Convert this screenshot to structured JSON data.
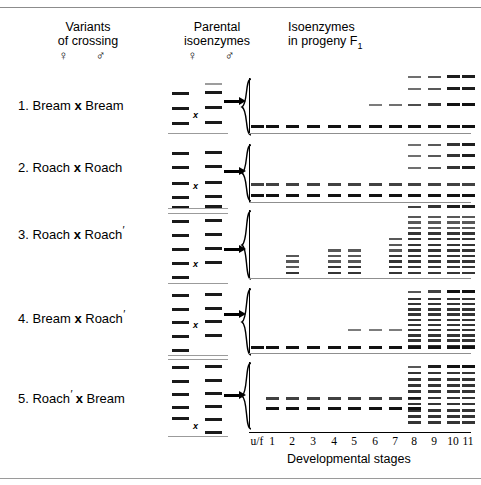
{
  "figure": {
    "headers": {
      "variants": {
        "line1": "Variants",
        "line2": "of crossing",
        "symbols": "♀ ♂"
      },
      "parental": {
        "line1": "Parental",
        "line2": "isoenzymes",
        "symbols": "♀ ♂"
      },
      "progeny": {
        "line1": "Isoenzymes",
        "line2": "in progeny F",
        "subscript": "1"
      }
    },
    "axis": {
      "title": "Developmental stages",
      "ticks": [
        "u/f",
        "1",
        "2",
        "3",
        "4",
        "5",
        "6",
        "7",
        "8",
        "9",
        "10",
        "11"
      ]
    },
    "colors": {
      "band": "#111111",
      "faint_band": "#9d9d9d",
      "rule": "#8c8c8c",
      "axis": "#8f8f8f"
    },
    "cross_symbol": "x",
    "prime_symbol": "′"
  },
  "chart_data": {
    "type": "heatmap",
    "xlabel": "Developmental stages",
    "ylabel": "Isoenzyme band mobility",
    "categories": [
      "u/f",
      "1",
      "2",
      "3",
      "4",
      "5",
      "6",
      "7",
      "8",
      "9",
      "10",
      "11"
    ],
    "legend": "none",
    "grid": false,
    "series": [
      {
        "name": "1. Bream x Bream",
        "female_parent_bands": 3,
        "male_parent_bands": 4,
        "stage_band_counts": [
          1,
          1,
          1,
          1,
          1,
          1,
          2,
          2,
          4,
          4,
          4,
          4
        ],
        "notes": "Single fast band across all stages; upper bands appear from stage 6-8 onward"
      },
      {
        "name": "2. Roach x Roach",
        "female_parent_bands": 4,
        "male_parent_bands": 4,
        "stage_band_counts": [
          2,
          2,
          2,
          2,
          2,
          2,
          2,
          2,
          5,
          5,
          5,
          5
        ],
        "notes": "Two bands through early stages; four-band upper cluster from stage 8"
      },
      {
        "name": "3. Roach x Roach'",
        "female_parent_bands": 6,
        "male_parent_bands": 5,
        "stage_band_counts": [
          0,
          0,
          4,
          0,
          5,
          5,
          0,
          7,
          11,
          11,
          11,
          11
        ],
        "notes": "Dense multi-band ladders increasing with developmental stage"
      },
      {
        "name": "4. Bream x Roach'",
        "female_parent_bands": 4,
        "male_parent_bands": 5,
        "stage_band_counts": [
          1,
          1,
          1,
          1,
          1,
          2,
          2,
          2,
          10,
          10,
          10,
          10
        ],
        "notes": "Single basal band; hybrid ladder emerges at stage 8"
      },
      {
        "name": "5. Roach' x Bream",
        "female_parent_bands": 6,
        "male_parent_bands": 6,
        "stage_band_counts": [
          0,
          2,
          2,
          2,
          2,
          2,
          2,
          2,
          9,
          9,
          9,
          9
        ],
        "notes": "Doublet through mid stages; dense ladder at late stages"
      }
    ]
  },
  "crosses": [
    {
      "index": "1.",
      "female": "Bream",
      "female_prime": false,
      "male": "Bream",
      "male_prime": false,
      "label": "1. Bream x Bream"
    },
    {
      "index": "2.",
      "female": "Roach",
      "female_prime": false,
      "male": "Roach",
      "male_prime": false,
      "label": "2. Roach x Roach"
    },
    {
      "index": "3.",
      "female": "Roach",
      "female_prime": false,
      "male": "Roach",
      "male_prime": true,
      "label": "3. Roach x Roach ′"
    },
    {
      "index": "4.",
      "female": "Bream",
      "female_prime": false,
      "male": "Roach",
      "male_prime": true,
      "label": "4. Bream x Roach ′"
    },
    {
      "index": "5.",
      "female": "Roach",
      "female_prime": true,
      "male": "Bream",
      "male_prime": false,
      "label": "5. Roach ′ x Bream"
    }
  ]
}
